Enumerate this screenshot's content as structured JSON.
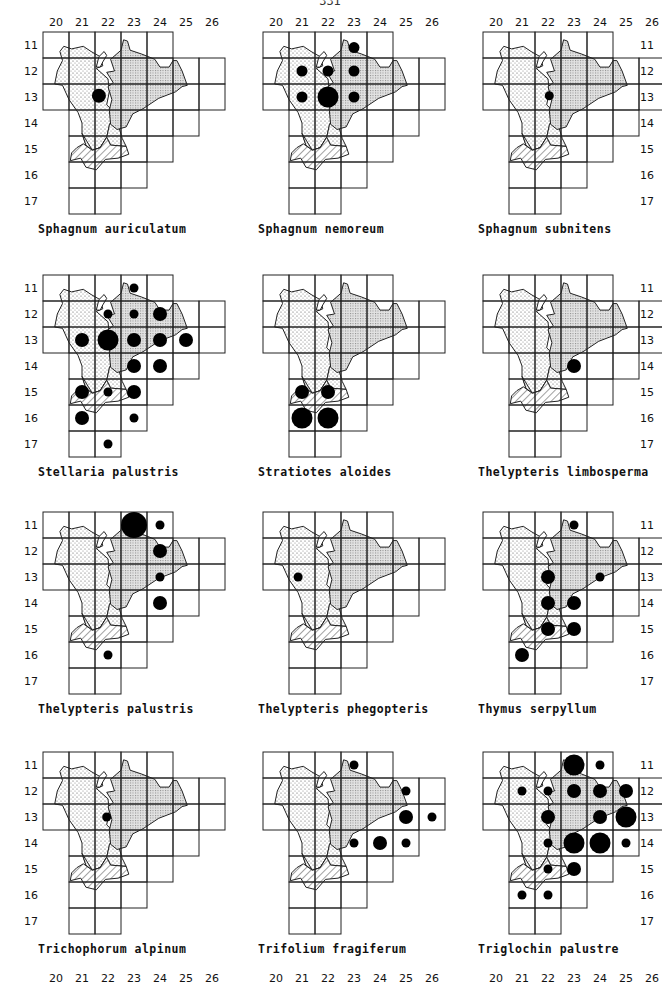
{
  "page": {
    "number": "331"
  },
  "grid": {
    "cols": [
      "20",
      "21",
      "22",
      "23",
      "24",
      "25",
      "26"
    ],
    "rows": [
      "11",
      "12",
      "13",
      "14",
      "15",
      "16",
      "17"
    ],
    "row_extents": {
      "11": [
        20,
        24
      ],
      "12": [
        20,
        26
      ],
      "13": [
        20,
        26
      ],
      "14": [
        21,
        25
      ],
      "15": [
        21,
        24
      ],
      "16": [
        21,
        23
      ],
      "17": [
        21,
        22
      ]
    }
  },
  "maps": [
    {
      "species": "Sphagnum auriculatum",
      "x": 0,
      "y": 0,
      "col_labels": "top",
      "row_labels": "left",
      "dots": [
        {
          "col": 22,
          "row": 13,
          "size": "m",
          "dx": -0.35,
          "dy": -0.05
        }
      ]
    },
    {
      "species": "Sphagnum nemoreum",
      "x": 220,
      "y": 0,
      "col_labels": "top",
      "row_labels": "none",
      "dots": [
        {
          "col": 23,
          "row": 11,
          "size": "s",
          "dy": 0.1
        },
        {
          "col": 21,
          "row": 12,
          "size": "s"
        },
        {
          "col": 22,
          "row": 12,
          "size": "s"
        },
        {
          "col": 23,
          "row": 12,
          "size": "s"
        },
        {
          "col": 21,
          "row": 13,
          "size": "s"
        },
        {
          "col": 22,
          "row": 13,
          "size": "l"
        },
        {
          "col": 23,
          "row": 13,
          "size": "s"
        }
      ]
    },
    {
      "species": "Sphagnum subnitens",
      "x": 440,
      "y": 0,
      "col_labels": "top",
      "row_labels": "right",
      "dots": [
        {
          "col": 22,
          "row": 13,
          "size": "xs",
          "dx": 0.05,
          "dy": -0.05
        }
      ]
    },
    {
      "species": "Stellaria palustris",
      "x": 0,
      "y": 243,
      "col_labels": "none",
      "row_labels": "left",
      "dots": [
        {
          "col": 23,
          "row": 11,
          "size": "xs"
        },
        {
          "col": 22,
          "row": 12,
          "size": "xs"
        },
        {
          "col": 23,
          "row": 12,
          "size": "xs"
        },
        {
          "col": 24,
          "row": 12,
          "size": "m"
        },
        {
          "col": 21,
          "row": 13,
          "size": "m"
        },
        {
          "col": 22,
          "row": 13,
          "size": "l"
        },
        {
          "col": 23,
          "row": 13,
          "size": "m"
        },
        {
          "col": 24,
          "row": 13,
          "size": "m"
        },
        {
          "col": 25,
          "row": 13,
          "size": "m"
        },
        {
          "col": 23,
          "row": 14,
          "size": "m"
        },
        {
          "col": 24,
          "row": 14,
          "size": "m"
        },
        {
          "col": 21,
          "row": 15,
          "size": "m"
        },
        {
          "col": 22,
          "row": 15,
          "size": "xs"
        },
        {
          "col": 23,
          "row": 15,
          "size": "m"
        },
        {
          "col": 21,
          "row": 16,
          "size": "m"
        },
        {
          "col": 23,
          "row": 16,
          "size": "xs"
        },
        {
          "col": 22,
          "row": 17,
          "size": "xs"
        }
      ]
    },
    {
      "species": "Stratiotes aloides",
      "x": 220,
      "y": 243,
      "col_labels": "none",
      "row_labels": "none",
      "dots": [
        {
          "col": 21,
          "row": 15,
          "size": "m"
        },
        {
          "col": 22,
          "row": 15,
          "size": "m"
        },
        {
          "col": 21,
          "row": 16,
          "size": "l"
        },
        {
          "col": 22,
          "row": 16,
          "size": "l"
        }
      ]
    },
    {
      "species": "Thelypteris limbosperma",
      "x": 440,
      "y": 243,
      "col_labels": "none",
      "row_labels": "right",
      "dots": [
        {
          "col": 23,
          "row": 14,
          "size": "m"
        }
      ]
    },
    {
      "species": "Thelypteris palustris",
      "x": 0,
      "y": 480,
      "col_labels": "none",
      "row_labels": "left",
      "dots": [
        {
          "col": 23,
          "row": 11,
          "size": "xl"
        },
        {
          "col": 24,
          "row": 11,
          "size": "xs"
        },
        {
          "col": 24,
          "row": 12,
          "size": "m"
        },
        {
          "col": 24,
          "row": 13,
          "size": "xs"
        },
        {
          "col": 24,
          "row": 14,
          "size": "m"
        },
        {
          "col": 22,
          "row": 16,
          "size": "xs"
        }
      ]
    },
    {
      "species": "Thelypteris phegopteris",
      "x": 220,
      "y": 480,
      "col_labels": "none",
      "row_labels": "none",
      "dots": [
        {
          "col": 21,
          "row": 13,
          "size": "xs",
          "dx": -0.15
        }
      ]
    },
    {
      "species": "Thymus serpyllum",
      "x": 440,
      "y": 480,
      "col_labels": "none",
      "row_labels": "right",
      "dots": [
        {
          "col": 23,
          "row": 11,
          "size": "xs"
        },
        {
          "col": 22,
          "row": 13,
          "size": "m"
        },
        {
          "col": 24,
          "row": 13,
          "size": "xs"
        },
        {
          "col": 22,
          "row": 14,
          "size": "m"
        },
        {
          "col": 23,
          "row": 14,
          "size": "m"
        },
        {
          "col": 22,
          "row": 15,
          "size": "m"
        },
        {
          "col": 23,
          "row": 15,
          "size": "m"
        },
        {
          "col": 21,
          "row": 16,
          "size": "m"
        }
      ]
    },
    {
      "species": "Trichophorum alpinum",
      "x": 0,
      "y": 720,
      "col_labels": "bottom",
      "row_labels": "left",
      "dots": [
        {
          "col": 22,
          "row": 13,
          "size": "xs",
          "dx": -0.05
        }
      ]
    },
    {
      "species": "Trifolium fragiferum",
      "x": 220,
      "y": 720,
      "col_labels": "bottom",
      "row_labels": "none",
      "dots": [
        {
          "col": 23,
          "row": 11,
          "size": "xs"
        },
        {
          "col": 25,
          "row": 12,
          "size": "xs"
        },
        {
          "col": 25,
          "row": 13,
          "size": "m"
        },
        {
          "col": 26,
          "row": 13,
          "size": "xs"
        },
        {
          "col": 23,
          "row": 14,
          "size": "xs"
        },
        {
          "col": 24,
          "row": 14,
          "size": "m"
        },
        {
          "col": 25,
          "row": 14,
          "size": "xs"
        }
      ]
    },
    {
      "species": "Triglochin palustre",
      "x": 440,
      "y": 720,
      "col_labels": "bottom",
      "row_labels": "right",
      "dots": [
        {
          "col": 23,
          "row": 11,
          "size": "l"
        },
        {
          "col": 24,
          "row": 11,
          "size": "xs"
        },
        {
          "col": 21,
          "row": 12,
          "size": "xs"
        },
        {
          "col": 22,
          "row": 12,
          "size": "xs"
        },
        {
          "col": 23,
          "row": 12,
          "size": "m"
        },
        {
          "col": 24,
          "row": 12,
          "size": "m"
        },
        {
          "col": 25,
          "row": 12,
          "size": "m"
        },
        {
          "col": 22,
          "row": 13,
          "size": "m"
        },
        {
          "col": 24,
          "row": 13,
          "size": "m"
        },
        {
          "col": 25,
          "row": 13,
          "size": "l"
        },
        {
          "col": 22,
          "row": 14,
          "size": "xs"
        },
        {
          "col": 23,
          "row": 14,
          "size": "l"
        },
        {
          "col": 24,
          "row": 14,
          "size": "l"
        },
        {
          "col": 25,
          "row": 14,
          "size": "xs"
        },
        {
          "col": 22,
          "row": 15,
          "size": "xs"
        },
        {
          "col": 23,
          "row": 15,
          "size": "m"
        },
        {
          "col": 21,
          "row": 16,
          "size": "xs"
        },
        {
          "col": 22,
          "row": 16,
          "size": "xs"
        }
      ]
    }
  ],
  "dot_radius": {
    "xs": 4.5,
    "s": 5.5,
    "m": 7,
    "l": 10.5,
    "xl": 13
  },
  "colors": {
    "ink": "#111111",
    "paper": "#ffffff",
    "stipple": "#777777",
    "grid": "#222222"
  }
}
